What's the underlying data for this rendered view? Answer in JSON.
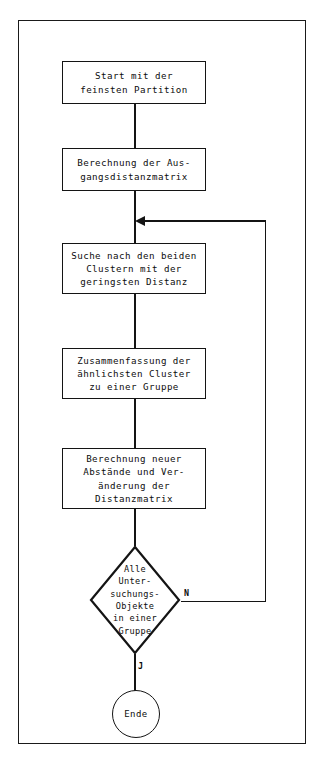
{
  "figure": {
    "background_color": "#ffffff",
    "line_color": "#141414",
    "text_color": "#0d0d0d"
  },
  "nodes": {
    "start": {
      "type": "process",
      "lines": [
        "Start mit der",
        "feinsten Partition"
      ]
    },
    "distance_matrix": {
      "type": "process",
      "lines": [
        "Berechnung der Aus-",
        "gangsdistanzmatrix"
      ]
    },
    "search_clusters": {
      "type": "process",
      "lines": [
        "Suche nach den beiden",
        "Clustern mit der",
        "geringsten Distanz"
      ]
    },
    "merge_clusters": {
      "type": "process",
      "lines": [
        "Zusammenfassung der",
        "ähnlichsten Cluster",
        "zu einer Gruppe"
      ]
    },
    "recalc_distances": {
      "type": "process",
      "lines": [
        "Berechnung neuer",
        "Abstände und Ver-",
        "änderung der",
        "Distanzmatrix"
      ]
    },
    "decision": {
      "type": "decision",
      "lines": [
        "Alle",
        "Unter-",
        "suchungs-",
        "Objekte",
        "in einer",
        "Gruppe"
      ]
    },
    "end": {
      "type": "terminal",
      "label": "Ende"
    }
  },
  "edge_labels": {
    "no": "N",
    "yes": "J"
  }
}
